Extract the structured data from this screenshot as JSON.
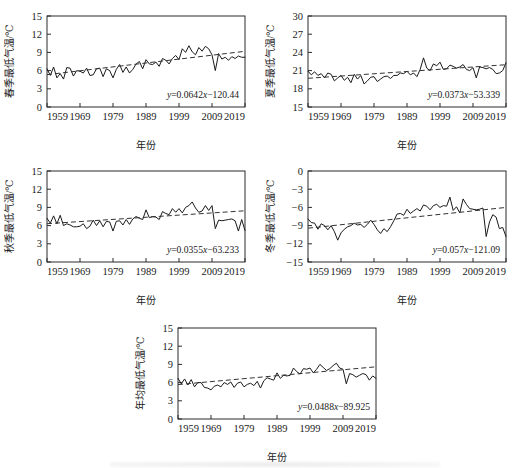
{
  "figure": {
    "panel_count": 5,
    "x_axis_title": "年份",
    "x_ticks": [
      "1959",
      "1969",
      "1979",
      "1989",
      "1999",
      "2009",
      "2019"
    ]
  },
  "chart_data": [
    {
      "id": "spring",
      "type": "line",
      "title": "",
      "ylabel": "春季最低气温/℃",
      "xlabel": "年份",
      "equation": "y=0.0642x−120.44",
      "slope": 0.0642,
      "intercept": -120.44,
      "grid": false,
      "legend": "none",
      "xlim": [
        1959,
        2019
      ],
      "ylim": [
        0,
        15
      ],
      "yticks": [
        0,
        3,
        6,
        9,
        12,
        15
      ],
      "xticks": [
        1959,
        1969,
        1979,
        1989,
        1999,
        2009,
        2019
      ],
      "x": [
        1959,
        1960,
        1961,
        1962,
        1963,
        1964,
        1965,
        1966,
        1967,
        1968,
        1969,
        1970,
        1971,
        1972,
        1973,
        1974,
        1975,
        1976,
        1977,
        1978,
        1979,
        1980,
        1981,
        1982,
        1983,
        1984,
        1985,
        1986,
        1987,
        1988,
        1989,
        1990,
        1991,
        1992,
        1993,
        1994,
        1995,
        1996,
        1997,
        1998,
        1999,
        2000,
        2001,
        2002,
        2003,
        2004,
        2005,
        2006,
        2007,
        2008,
        2009,
        2010,
        2011,
        2012,
        2013,
        2014,
        2015,
        2016,
        2017,
        2018,
        2019
      ],
      "values": [
        6.3,
        5.2,
        6.6,
        4.8,
        5.5,
        4.6,
        6.5,
        6.4,
        5.1,
        6.0,
        5.9,
        5.6,
        6.4,
        5.2,
        5.3,
        6.3,
        6.4,
        5.0,
        6.3,
        6.0,
        4.8,
        6.2,
        7.0,
        5.7,
        6.6,
        5.6,
        6.2,
        7.1,
        7.5,
        6.3,
        7.8,
        7.1,
        7.0,
        7.4,
        6.7,
        8.0,
        7.7,
        7.1,
        8.0,
        8.5,
        7.8,
        9.6,
        9.0,
        10.1,
        9.1,
        8.6,
        9.8,
        9.2,
        10.0,
        9.6,
        8.6,
        6.0,
        8.8,
        7.9,
        8.2,
        7.7,
        8.3,
        8.0,
        8.4,
        8.2,
        8.2
      ]
    },
    {
      "id": "summer",
      "type": "line",
      "title": "",
      "ylabel": "夏季最低气温/℃",
      "xlabel": "年份",
      "equation": "y=0.0373x−53.339",
      "slope": 0.0373,
      "intercept": -53.339,
      "grid": false,
      "legend": "none",
      "xlim": [
        1959,
        2019
      ],
      "ylim": [
        15,
        30
      ],
      "yticks": [
        15,
        18,
        21,
        24,
        27,
        30
      ],
      "xticks": [
        1959,
        1969,
        1979,
        1989,
        1999,
        2009,
        2019
      ],
      "x": [
        1959,
        1960,
        1961,
        1962,
        1963,
        1964,
        1965,
        1966,
        1967,
        1968,
        1969,
        1970,
        1971,
        1972,
        1973,
        1974,
        1975,
        1976,
        1977,
        1978,
        1979,
        1980,
        1981,
        1982,
        1983,
        1984,
        1985,
        1986,
        1987,
        1988,
        1989,
        1990,
        1991,
        1992,
        1993,
        1994,
        1995,
        1996,
        1997,
        1998,
        1999,
        2000,
        2001,
        2002,
        2003,
        2004,
        2005,
        2006,
        2007,
        2008,
        2009,
        2010,
        2011,
        2012,
        2013,
        2014,
        2015,
        2016,
        2017,
        2018,
        2019
      ],
      "values": [
        20.9,
        20.3,
        20.8,
        20.2,
        20.5,
        19.8,
        20.6,
        20.4,
        19.3,
        19.8,
        20.2,
        19.4,
        19.9,
        19.0,
        20.4,
        19.6,
        20.2,
        18.8,
        19.3,
        19.9,
        20.0,
        19.2,
        19.6,
        20.0,
        20.1,
        19.7,
        20.2,
        20.2,
        20.6,
        20.5,
        20.9,
        20.3,
        20.6,
        20.0,
        21.2,
        23.1,
        21.4,
        21.0,
        22.1,
        21.8,
        22.4,
        21.2,
        21.3,
        21.9,
        21.7,
        21.4,
        21.6,
        22.0,
        21.2,
        21.0,
        21.5,
        19.8,
        21.6,
        21.5,
        21.3,
        21.5,
        21.2,
        20.5,
        20.6,
        21.0,
        22.3
      ]
    },
    {
      "id": "autumn",
      "type": "line",
      "title": "",
      "ylabel": "秋季最低气温/℃",
      "xlabel": "年份",
      "equation": "y=0.0355x−63.233",
      "slope": 0.0355,
      "intercept": -63.233,
      "grid": false,
      "legend": "none",
      "xlim": [
        1959,
        2019
      ],
      "ylim": [
        0,
        15
      ],
      "yticks": [
        0,
        3,
        6,
        9,
        12,
        15
      ],
      "xticks": [
        1959,
        1969,
        1979,
        1989,
        1999,
        2009,
        2019
      ],
      "x": [
        1959,
        1960,
        1961,
        1962,
        1963,
        1964,
        1965,
        1966,
        1967,
        1968,
        1969,
        1970,
        1971,
        1972,
        1973,
        1974,
        1975,
        1976,
        1977,
        1978,
        1979,
        1980,
        1981,
        1982,
        1983,
        1984,
        1985,
        1986,
        1987,
        1988,
        1989,
        1990,
        1991,
        1992,
        1993,
        1994,
        1995,
        1996,
        1997,
        1998,
        1999,
        2000,
        2001,
        2002,
        2003,
        2004,
        2005,
        2006,
        2007,
        2008,
        2009,
        2010,
        2011,
        2012,
        2013,
        2014,
        2015,
        2016,
        2017,
        2018,
        2019
      ],
      "values": [
        7.2,
        6.4,
        7.6,
        6.3,
        7.7,
        6.0,
        6.3,
        6.1,
        5.8,
        5.8,
        5.9,
        6.3,
        5.5,
        5.9,
        6.9,
        6.0,
        6.8,
        5.8,
        6.7,
        6.6,
        5.1,
        6.7,
        6.8,
        6.1,
        7.0,
        6.2,
        7.1,
        7.5,
        7.2,
        7.0,
        8.6,
        7.3,
        7.5,
        7.4,
        7.0,
        8.3,
        8.0,
        7.8,
        8.8,
        8.2,
        8.8,
        8.1,
        9.0,
        9.3,
        9.9,
        8.9,
        8.2,
        8.4,
        9.3,
        8.5,
        9.3,
        5.5,
        6.9,
        6.8,
        6.9,
        7.0,
        7.1,
        6.8,
        5.1,
        7.0,
        5.2
      ]
    },
    {
      "id": "winter",
      "type": "line",
      "title": "",
      "ylabel": "冬季最低气温/℃",
      "xlabel": "年份",
      "equation": "y=0.057x−121.09",
      "slope": 0.057,
      "intercept": -121.09,
      "grid": false,
      "legend": "none",
      "xlim": [
        1959,
        2019
      ],
      "ylim": [
        -15,
        0
      ],
      "yticks": [
        -15,
        -12,
        -9,
        -6,
        -3,
        0
      ],
      "xticks": [
        1959,
        1969,
        1979,
        1989,
        1999,
        2009,
        2019
      ],
      "x": [
        1959,
        1960,
        1961,
        1962,
        1963,
        1964,
        1965,
        1966,
        1967,
        1968,
        1969,
        1970,
        1971,
        1972,
        1973,
        1974,
        1975,
        1976,
        1977,
        1978,
        1979,
        1980,
        1981,
        1982,
        1983,
        1984,
        1985,
        1986,
        1987,
        1988,
        1989,
        1990,
        1991,
        1992,
        1993,
        1994,
        1995,
        1996,
        1997,
        1998,
        1999,
        2000,
        2001,
        2002,
        2003,
        2004,
        2005,
        2006,
        2007,
        2008,
        2009,
        2010,
        2011,
        2012,
        2013,
        2014,
        2015,
        2016,
        2017,
        2018,
        2019
      ],
      "values": [
        -7.9,
        -8.5,
        -8.6,
        -9.6,
        -8.7,
        -9.0,
        -9.7,
        -9.0,
        -10.0,
        -11.4,
        -10.2,
        -9.6,
        -9.2,
        -9.0,
        -8.6,
        -8.9,
        -8.8,
        -9.3,
        -8.8,
        -8.1,
        -8.8,
        -9.7,
        -10.3,
        -9.5,
        -10.0,
        -9.2,
        -8.2,
        -7.1,
        -7.0,
        -7.3,
        -6.3,
        -7.0,
        -6.6,
        -6.2,
        -6.6,
        -5.6,
        -5.8,
        -6.4,
        -5.7,
        -5.5,
        -6.0,
        -5.7,
        -5.8,
        -4.3,
        -6.5,
        -5.9,
        -6.9,
        -4.6,
        -5.5,
        -6.2,
        -6.3,
        -6.4,
        -6.3,
        -6.1,
        -10.8,
        -8.4,
        -7.2,
        -7.6,
        -9.5,
        -9.3,
        -10.8
      ]
    },
    {
      "id": "annual",
      "type": "line",
      "title": "",
      "ylabel": "年均最低气温/℃",
      "xlabel": "年份",
      "equation": "y=0.0488x−89.925",
      "slope": 0.0488,
      "intercept": -89.925,
      "grid": false,
      "legend": "none",
      "xlim": [
        1959,
        2019
      ],
      "ylim": [
        0,
        15
      ],
      "yticks": [
        0,
        3,
        6,
        9,
        12,
        15
      ],
      "xticks": [
        1959,
        1969,
        1979,
        1989,
        1999,
        2009,
        2019
      ],
      "x": [
        1959,
        1960,
        1961,
        1962,
        1963,
        1964,
        1965,
        1966,
        1967,
        1968,
        1969,
        1970,
        1971,
        1972,
        1973,
        1974,
        1975,
        1976,
        1977,
        1978,
        1979,
        1980,
        1981,
        1982,
        1983,
        1984,
        1985,
        1986,
        1987,
        1988,
        1989,
        1990,
        1991,
        1992,
        1993,
        1994,
        1995,
        1996,
        1997,
        1998,
        1999,
        2000,
        2001,
        2002,
        2003,
        2004,
        2005,
        2006,
        2007,
        2008,
        2009,
        2010,
        2011,
        2012,
        2013,
        2014,
        2015,
        2016,
        2017,
        2018,
        2019
      ],
      "values": [
        6.7,
        5.8,
        6.6,
        5.6,
        6.5,
        5.3,
        6.0,
        6.0,
        5.2,
        5.1,
        4.8,
        5.4,
        5.6,
        5.3,
        6.0,
        5.7,
        6.1,
        5.2,
        5.9,
        6.1,
        5.3,
        5.7,
        5.9,
        5.5,
        6.2,
        5.1,
        6.3,
        6.8,
        6.6,
        6.4,
        7.6,
        6.7,
        7.2,
        7.1,
        7.2,
        8.4,
        7.8,
        7.4,
        8.3,
        8.2,
        8.4,
        7.6,
        8.2,
        9.0,
        8.5,
        8.0,
        8.3,
        8.8,
        9.2,
        8.4,
        8.2,
        5.8,
        7.5,
        7.3,
        6.9,
        7.2,
        7.5,
        7.3,
        6.4,
        7.1,
        6.7
      ]
    }
  ]
}
